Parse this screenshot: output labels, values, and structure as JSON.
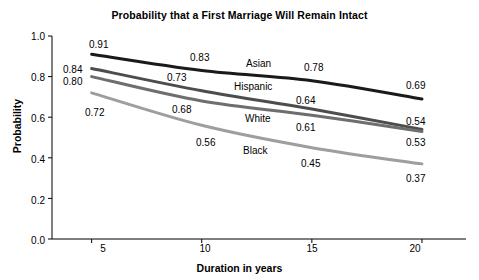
{
  "chart_data": {
    "type": "line",
    "title": "Probability that a First Marriage Will Remain Intact",
    "xlabel": "Duration in years",
    "ylabel": "Probability",
    "x": [
      5,
      10,
      15,
      20
    ],
    "xlim": [
      3.2,
      22.0
    ],
    "ylim": [
      0.0,
      1.0
    ],
    "xticks": [
      "5",
      "10",
      "15",
      "20"
    ],
    "yticks": [
      "0.0",
      "0.2",
      "0.4",
      "0.6",
      "0.8",
      "1.0"
    ],
    "grid": false,
    "legend_position": "inline-labels",
    "series": [
      {
        "name": "Asian",
        "color": "#1a1a1a",
        "values": [
          0.91,
          0.83,
          0.78,
          0.69
        ],
        "labels": [
          "0.91",
          "0.83",
          "0.78",
          "0.69"
        ]
      },
      {
        "name": "Hispanic",
        "color": "#4d4d4d",
        "values": [
          0.84,
          0.73,
          0.64,
          0.54
        ],
        "labels": [
          "0.84",
          "0.73",
          "0.64",
          "0.54"
        ]
      },
      {
        "name": "White",
        "color": "#6e6e6e",
        "values": [
          0.8,
          0.68,
          0.61,
          0.53
        ],
        "labels": [
          "0.80",
          "0.68",
          "0.61",
          "0.53"
        ]
      },
      {
        "name": "Black",
        "color": "#9e9e9e",
        "values": [
          0.72,
          0.56,
          0.45,
          0.37
        ],
        "labels": [
          "0.72",
          "0.56",
          "0.45",
          "0.37"
        ]
      }
    ]
  },
  "axis": {
    "yticks": [
      {
        "text": "1.0",
        "top": 31
      },
      {
        "text": "0.8",
        "top": 72
      },
      {
        "text": "0.6",
        "top": 113
      },
      {
        "text": "0.4",
        "top": 154
      },
      {
        "text": "0.2",
        "top": 195
      },
      {
        "text": "0.0",
        "top": 235
      }
    ],
    "xticks": [
      {
        "text": "5",
        "left": 88
      },
      {
        "text": "10",
        "left": 190
      },
      {
        "text": "15",
        "left": 297
      },
      {
        "text": "20",
        "left": 400
      }
    ]
  },
  "annotations": {
    "points": [
      {
        "text": "0.91",
        "left": 89,
        "top": 39
      },
      {
        "text": "0.84",
        "left": 63,
        "top": 64
      },
      {
        "text": "0.80",
        "left": 63,
        "top": 76
      },
      {
        "text": "0.72",
        "left": 85,
        "top": 107
      },
      {
        "text": "0.83",
        "left": 190,
        "top": 52
      },
      {
        "text": "0.73",
        "left": 167,
        "top": 72
      },
      {
        "text": "0.68",
        "left": 172,
        "top": 104
      },
      {
        "text": "0.56",
        "left": 196,
        "top": 137
      },
      {
        "text": "0.78",
        "left": 304,
        "top": 62
      },
      {
        "text": "0.64",
        "left": 296,
        "top": 95
      },
      {
        "text": "0.61",
        "left": 296,
        "top": 122
      },
      {
        "text": "0.45",
        "left": 301,
        "top": 158
      },
      {
        "text": "0.69",
        "left": 406,
        "top": 80
      },
      {
        "text": "0.54",
        "left": 406,
        "top": 116
      },
      {
        "text": "0.53",
        "left": 406,
        "top": 137
      },
      {
        "text": "0.37",
        "left": 406,
        "top": 173
      }
    ],
    "series_labels": [
      {
        "text": "Asian",
        "left": 246,
        "top": 58
      },
      {
        "text": "Hispanic",
        "left": 234,
        "top": 81
      },
      {
        "text": "White",
        "left": 245,
        "top": 113
      },
      {
        "text": "Black",
        "left": 243,
        "top": 145
      }
    ]
  }
}
